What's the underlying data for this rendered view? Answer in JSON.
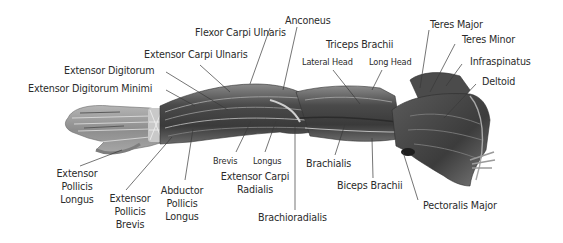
{
  "diagram": {
    "colors": {
      "background": "#ffffff",
      "text": "#2b2b2b",
      "leader": "#3a3a3a",
      "muscle_dark": "#3e3e3e",
      "muscle_mid": "#6b6b6b",
      "muscle_light": "#a9a9a9",
      "tendon": "#d8d8d8"
    },
    "labels": {
      "anconeus": "Anconeus",
      "flexor_carpi_ulnaris": "Flexor Carpi Ulnaris",
      "extensor_carpi_ulnaris": "Extensor Carpi Ulnaris",
      "extensor_digitorum": "Extensor Digitorum",
      "extensor_digitorum_minimi": "Extensor Digitorum Minimi",
      "triceps_brachii": "Triceps Brachii",
      "lateral_head": "Lateral Head",
      "long_head": "Long Head",
      "teres_major": "Teres Major",
      "teres_minor": "Teres Minor",
      "infraspinatus": "Infraspinatus",
      "deltoid": "Deltoid",
      "extensor_pollicis_longus": [
        "Extensor",
        "Pollicis",
        "Longus"
      ],
      "extensor_pollicis_brevis": [
        "Extensor",
        "Pollicis",
        "Brevis"
      ],
      "abductor_pollicis_longus": [
        "Abductor",
        "Pollicis",
        "Longus"
      ],
      "brevis": "Brevis",
      "longus": "Longus",
      "extensor_carpi_radialis": [
        "Extensor Carpi",
        "Radialis"
      ],
      "brachioradialis": "Brachioradialis",
      "brachialis": "Brachialis",
      "biceps_brachii": "Biceps Brachii",
      "pectoralis_major": "Pectoralis Major"
    }
  }
}
